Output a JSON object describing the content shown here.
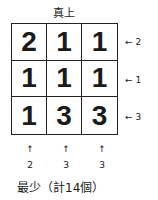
{
  "diagram": {
    "title": "真上",
    "grid": [
      [
        "2",
        "1",
        "1"
      ],
      [
        "1",
        "1",
        "1"
      ],
      [
        "1",
        "3",
        "3"
      ]
    ],
    "row_labels": [
      "2",
      "1",
      "3"
    ],
    "column_labels": [
      "2",
      "3",
      "3"
    ],
    "arrow_left": "←",
    "arrow_up": "↑",
    "caption": "最少（計14個）"
  }
}
